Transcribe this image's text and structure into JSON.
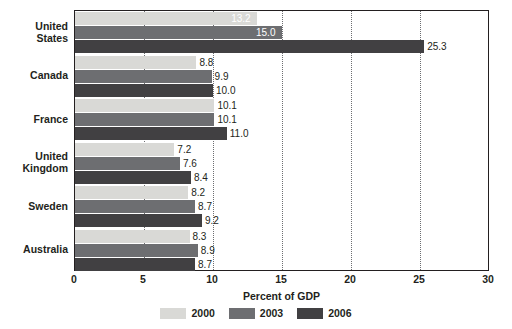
{
  "chart_data": {
    "type": "bar",
    "orientation": "horizontal",
    "title": "",
    "xlabel": "Percent of GDP",
    "ylabel": "",
    "xlim": [
      0,
      30
    ],
    "xticks": [
      0,
      5,
      10,
      15,
      20,
      25,
      30
    ],
    "xtick_labels": [
      "0",
      "5",
      "10",
      "15",
      "20",
      "25",
      "30"
    ],
    "grid": "vertical-dotted",
    "legend_position": "bottom-center",
    "categories": [
      "United States",
      "Canada",
      "France",
      "United Kingdom",
      "Sweden",
      "Australia"
    ],
    "category_lines": [
      [
        "United",
        "States"
      ],
      [
        "Canada"
      ],
      [
        "France"
      ],
      [
        "United",
        "Kingdom"
      ],
      [
        "Sweden"
      ],
      [
        "Australia"
      ]
    ],
    "series": [
      {
        "name": "2000",
        "color": "#d9d9d6",
        "values": [
          13.2,
          8.8,
          10.1,
          7.2,
          8.2,
          8.3
        ],
        "labels": [
          "13.2",
          "8.8",
          "10.1",
          "7.2",
          "8.2",
          "8.3"
        ]
      },
      {
        "name": "2003",
        "color": "#6d6e71",
        "values": [
          15.0,
          9.9,
          10.1,
          7.6,
          8.7,
          8.9
        ],
        "labels": [
          "15.0",
          "9.9",
          "10.1",
          "7.6",
          "8.7",
          "8.9"
        ]
      },
      {
        "name": "2006",
        "color": "#414042",
        "values": [
          25.3,
          10.0,
          11.0,
          8.4,
          9.2,
          8.7
        ],
        "labels": [
          "25.3",
          "10.0",
          "11.0",
          "8.4",
          "9.2",
          "8.7"
        ]
      }
    ]
  }
}
